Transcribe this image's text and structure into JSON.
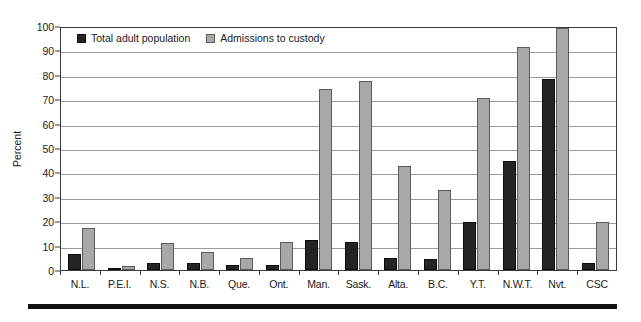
{
  "chart_data": {
    "type": "bar",
    "title": "",
    "xlabel": "",
    "ylabel": "Percent",
    "ylim": [
      0,
      100
    ],
    "ytick_step": 10,
    "yticks": [
      100,
      90,
      80,
      70,
      60,
      50,
      40,
      30,
      20,
      10,
      0
    ],
    "grid": true,
    "legend_position": "top-left-inside",
    "categories": [
      "N.L.",
      "P.E.I.",
      "N.S.",
      "N.B.",
      "Que.",
      "Ont.",
      "Man.",
      "Sask.",
      "Alta.",
      "B.C.",
      "Y.T.",
      "N.W.T.",
      "Nvt.",
      "CSC"
    ],
    "series": [
      {
        "name": "Total adult population",
        "color": "#242424",
        "values": [
          6.5,
          0.5,
          3,
          3,
          2,
          2,
          12.5,
          11.5,
          5,
          4.5,
          20,
          45,
          79,
          3
        ]
      },
      {
        "name": "Admissions to custody",
        "color": "#a8a8a8",
        "values": [
          17.5,
          1.5,
          11,
          7.5,
          5,
          11.5,
          75,
          78,
          43,
          33,
          71,
          92,
          100,
          20
        ]
      }
    ]
  },
  "legend": {
    "entries": [
      {
        "label": "Total adult population",
        "swatch": "dark-swatch-icon"
      },
      {
        "label": "Admissions to custody",
        "swatch": "light-swatch-icon"
      }
    ]
  },
  "axes": {
    "y_label": "Percent",
    "y_ticks": [
      "100",
      "90",
      "80",
      "70",
      "60",
      "50",
      "40",
      "30",
      "20",
      "10",
      "0"
    ],
    "x_ticks": [
      "N.L.",
      "P.E.I.",
      "N.S.",
      "N.B.",
      "Que.",
      "Ont.",
      "Man.",
      "Sask.",
      "Alta.",
      "B.C.",
      "Y.T.",
      "N.W.T.",
      "Nvt.",
      "CSC"
    ]
  },
  "colors": {
    "series_dark": "#242424",
    "series_light": "#a8a8a8",
    "gridline": "#9a9a9a",
    "axis": "#3a3a3a",
    "rule": "#111111",
    "background": "#ffffff"
  }
}
